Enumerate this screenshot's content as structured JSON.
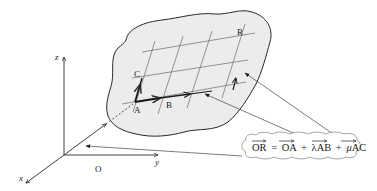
{
  "diagram": {
    "axes": {
      "z_label": "z",
      "y_label": "y",
      "x_label": "x",
      "origin_label": "O"
    },
    "points": {
      "A": "A",
      "B": "B",
      "C": "C",
      "R": "R"
    },
    "formula": {
      "lhs": "OR",
      "eq": "=",
      "t1": "OA",
      "plus1": "+",
      "lambda": "λ",
      "t2": "AB",
      "plus2": "+",
      "mu": "μ",
      "t3": "AC",
      "full_text": "OR = OA + λAB + μAC"
    },
    "colors": {
      "plane_fill": "#ececec",
      "stroke": "#2a2a2a",
      "grid": "#555555"
    }
  }
}
